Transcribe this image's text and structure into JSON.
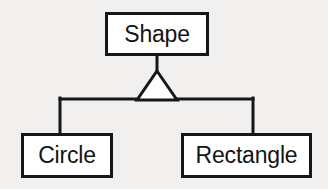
{
  "diagram": {
    "kind": "uml-class-diagram",
    "relationship_label": "generalization",
    "canvas": {
      "width": 328,
      "height": 189,
      "background_color": "#f1f0ee"
    },
    "style": {
      "node_fill": "#ffffff",
      "node_stroke": "#171717",
      "node_stroke_width": 3,
      "connector_stroke": "#171717",
      "connector_stroke_width": 3,
      "text_color": "#141414",
      "arrowhead": "hollow-triangle"
    },
    "nodes": [
      {
        "id": "shape",
        "label": "Shape",
        "role": "superclass",
        "x": 105,
        "y": 12,
        "width": 104,
        "height": 44
      },
      {
        "id": "circle",
        "label": "Circle",
        "role": "subclass",
        "x": 21,
        "y": 133,
        "width": 92,
        "height": 45
      },
      {
        "id": "rectangle",
        "label": "Rectangle",
        "role": "subclass",
        "x": 181,
        "y": 133,
        "width": 131,
        "height": 45
      }
    ],
    "edges": [
      {
        "id": "edge-circle-to-shape",
        "from": "circle",
        "to": "shape",
        "type": "generalization"
      },
      {
        "id": "edge-rectangle-to-shape",
        "from": "rectangle",
        "to": "shape",
        "type": "generalization"
      }
    ],
    "connector_geometry": {
      "stub_x": 157,
      "stub_top_y": 56,
      "stub_bottom_y": 72,
      "triangle_apex_x": 157,
      "triangle_apex_y": 72,
      "triangle_left_x": 138,
      "triangle_right_x": 176,
      "triangle_base_y": 99,
      "bus_y": 99,
      "bus_left_x": 60,
      "bus_right_x": 253,
      "drop_bottom_y": 133
    }
  }
}
